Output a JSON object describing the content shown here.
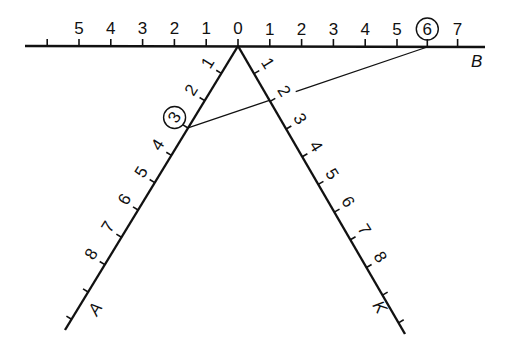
{
  "diagram": {
    "colors": {
      "ink": "#111111",
      "background": "#ffffff"
    },
    "axes": {
      "B": {
        "label": "B",
        "orientation": "horizontal",
        "left_labels": [
          "1",
          "2",
          "3",
          "4",
          "5"
        ],
        "right_labels": [
          "1",
          "2",
          "3",
          "4",
          "5",
          "6",
          "7"
        ],
        "origin_label": "0",
        "highlighted": "6"
      },
      "A": {
        "label": "A",
        "orientation": "down-left",
        "labels": [
          "1",
          "2",
          "3",
          "4",
          "5",
          "6",
          "7",
          "8"
        ],
        "highlighted": "3"
      },
      "K": {
        "label": "K",
        "orientation": "down-right",
        "labels": [
          "1",
          "2",
          "3",
          "4",
          "5",
          "6",
          "7",
          "8"
        ]
      }
    },
    "connector": {
      "from": "A:3",
      "to": "B:6",
      "note": "line joining point 3 on A to point 6 on B"
    }
  }
}
